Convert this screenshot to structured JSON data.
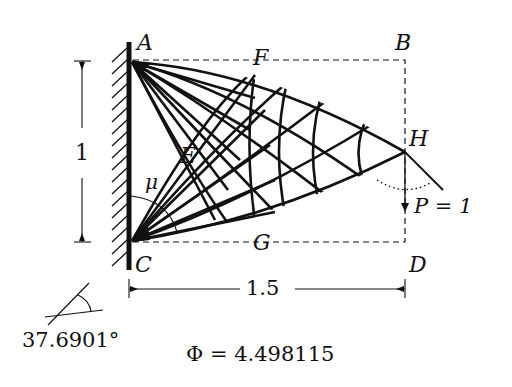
{
  "figure": {
    "points": {
      "A": "A",
      "B": "B",
      "C": "C",
      "D": "D",
      "E": "E",
      "F": "F",
      "G": "G",
      "H": "H"
    },
    "angle_symbol": "μ",
    "load_label": "P = 1",
    "height_dimension": "1",
    "width_dimension": "1.5",
    "angle_value": "37.6901°",
    "phi_value": "Φ = 4.498115"
  },
  "colors": {
    "ink": "#111111",
    "background": "#ffffff"
  }
}
